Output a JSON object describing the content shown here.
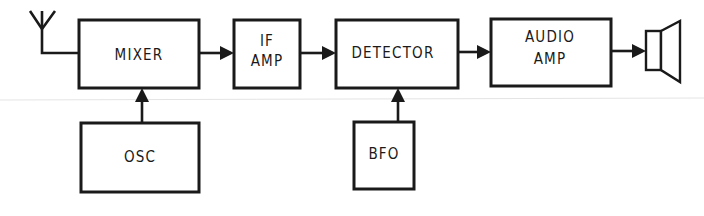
{
  "diagram": {
    "type": "block-diagram",
    "blocks": {
      "mixer": {
        "label_lines": [
          "MIXER"
        ]
      },
      "if_amp": {
        "label_lines": [
          "IF",
          "AMP"
        ]
      },
      "detector": {
        "label_lines": [
          "DETECTOR"
        ]
      },
      "audio_amp": {
        "label_lines": [
          "AUDIO",
          "AMP"
        ]
      },
      "osc": {
        "label_lines": [
          "OSC"
        ]
      },
      "bfo": {
        "label_lines": [
          "BFO"
        ]
      }
    },
    "connections": [
      {
        "from": "antenna",
        "to": "mixer"
      },
      {
        "from": "mixer",
        "to": "if_amp"
      },
      {
        "from": "if_amp",
        "to": "detector"
      },
      {
        "from": "detector",
        "to": "audio_amp"
      },
      {
        "from": "audio_amp",
        "to": "speaker"
      },
      {
        "from": "osc",
        "to": "mixer"
      },
      {
        "from": "bfo",
        "to": "detector"
      }
    ],
    "icons": {
      "antenna": "antenna-icon",
      "speaker": "speaker-icon"
    }
  }
}
